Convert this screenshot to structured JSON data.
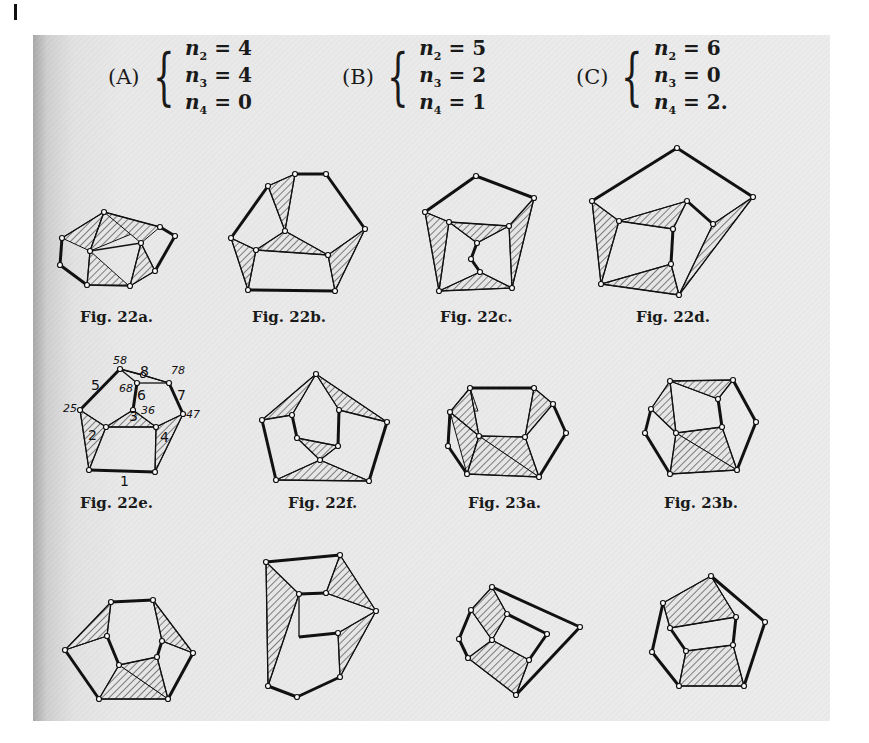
{
  "conditions": [
    {
      "label": "(A)",
      "eqs": [
        {
          "var": "n",
          "sub": "2",
          "val": "4"
        },
        {
          "var": "n",
          "sub": "3",
          "val": "4"
        },
        {
          "var": "n",
          "sub": "4",
          "val": "0"
        }
      ]
    },
    {
      "label": "(B)",
      "eqs": [
        {
          "var": "n",
          "sub": "2",
          "val": "5"
        },
        {
          "var": "n",
          "sub": "3",
          "val": "2"
        },
        {
          "var": "n",
          "sub": "4",
          "val": "1"
        }
      ]
    },
    {
      "label": "(C)",
      "eqs": [
        {
          "var": "n",
          "sub": "2",
          "val": "6"
        },
        {
          "var": "n",
          "sub": "3",
          "val": "0"
        },
        {
          "var": "n",
          "sub": "4",
          "val": "2."
        }
      ]
    }
  ],
  "captions": {
    "fig22a": "Fig. 22a.",
    "fig22b": "Fig. 22b.",
    "fig22c": "Fig. 22c.",
    "fig22d": "Fig. 22d.",
    "fig22e": "Fig. 22e.",
    "fig22f": "Fig. 22f.",
    "fig23a": "Fig. 23a.",
    "fig23b": "Fig. 23b."
  },
  "fig22e_labels": {
    "edges": [
      "1",
      "2",
      "3",
      "4",
      "5",
      "6",
      "7",
      "8"
    ],
    "vertices": [
      "25",
      "58",
      "68",
      "78",
      "36",
      "47"
    ]
  }
}
